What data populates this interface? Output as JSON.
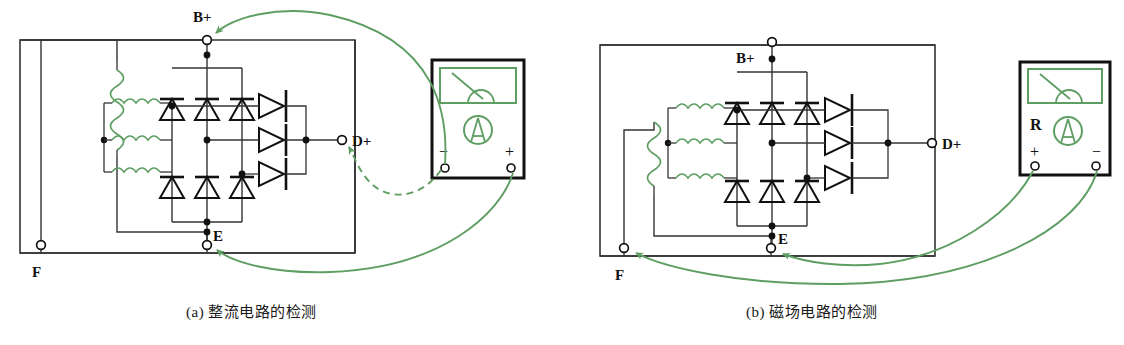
{
  "figure": {
    "panels": [
      {
        "id": "a",
        "caption": "(a) 整流电路的检测",
        "caption_prefix": "(a)",
        "caption_text": "整流电路的检测",
        "terminals": [
          {
            "name": "B+",
            "label": "B+",
            "x": 207,
            "y": 37
          },
          {
            "name": "D+",
            "label": "D+",
            "x": 342,
            "y": 140
          },
          {
            "name": "E",
            "label": "E",
            "x": 207,
            "y": 245
          },
          {
            "name": "F",
            "label": "F",
            "x": 41,
            "y": 245
          }
        ],
        "meter": {
          "name": "multimeter",
          "left_probe_label": "−",
          "right_probe_label": "+",
          "range_label": "",
          "x": 432,
          "y": 60,
          "w": 92,
          "h": 118
        },
        "probe_leads": [
          {
            "from": "meter-minus",
            "to": "B+",
            "style": "solid"
          },
          {
            "from": "meter-minus",
            "to": "D+",
            "style": "dashed"
          },
          {
            "from": "meter-plus",
            "to": "E",
            "style": "solid"
          }
        ]
      },
      {
        "id": "b",
        "caption": "(b) 磁场电路的检测",
        "caption_prefix": "(b)",
        "caption_text": "磁场电路的检测",
        "terminals": [
          {
            "name": "B+",
            "label": "B+",
            "x": 772,
            "y": 42
          },
          {
            "name": "D+",
            "label": "D+",
            "x": 932,
            "y": 140
          },
          {
            "name": "E",
            "label": "E",
            "x": 771,
            "y": 248
          },
          {
            "name": "F",
            "label": "F",
            "x": 624,
            "y": 248
          }
        ],
        "meter": {
          "name": "multimeter",
          "left_probe_label": "+",
          "right_probe_label": "−",
          "range_label": "R",
          "x": 1020,
          "y": 62,
          "w": 90,
          "h": 113
        },
        "probe_leads": [
          {
            "from": "meter-plus",
            "to": "E",
            "style": "solid"
          },
          {
            "from": "meter-minus",
            "to": "F",
            "style": "solid"
          }
        ]
      }
    ],
    "components": {
      "rectifier_diodes_upper": 3,
      "rectifier_diodes_lower": 3,
      "field_diodes": 3,
      "stator_windings": 3,
      "field_winding": 1
    },
    "colors": {
      "wire": "#222222",
      "frame": "#333333",
      "green": "#5f9e63",
      "green_dark": "#4e8f55",
      "text": "#1a1a1a",
      "background": "#ffffff"
    }
  }
}
